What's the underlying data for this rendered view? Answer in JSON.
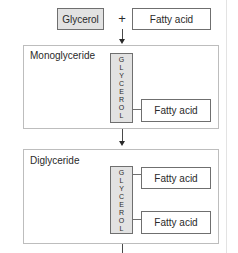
{
  "top": {
    "glycerol_label": "Glycerol",
    "plus": "+",
    "fatty_acid_label": "Fatty acid"
  },
  "monoglyceride": {
    "title": "Monoglyceride",
    "glycerol_letters": [
      "G",
      "L",
      "Y",
      "C",
      "E",
      "R",
      "O",
      "L"
    ],
    "fatty_acids": [
      "Fatty acid"
    ]
  },
  "diglyceride": {
    "title": "Diglyceride",
    "glycerol_letters": [
      "G",
      "L",
      "Y",
      "C",
      "E",
      "R",
      "O",
      "L"
    ],
    "fatty_acids": [
      "Fatty acid",
      "Fatty acid"
    ]
  },
  "colors": {
    "glycerol_fill": "#e2e2e2",
    "border": "#6f6f6f",
    "panel_border": "#bdbdbd"
  }
}
